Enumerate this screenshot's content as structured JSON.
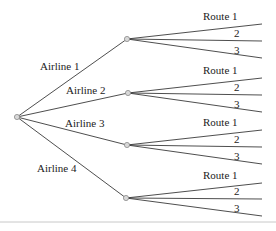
{
  "diagram": {
    "type": "tree",
    "root": {
      "x": 17,
      "y": 117
    },
    "airlines": [
      {
        "label": "Airline 1",
        "node": {
          "x": 127,
          "y": 39
        },
        "label_pos": {
          "x": 40,
          "y": 70
        },
        "routes": [
          {
            "label": "Route 1",
            "end_y": 24
          },
          {
            "label": "2",
            "end_y": 41
          },
          {
            "label": "3",
            "end_y": 58
          }
        ]
      },
      {
        "label": "Airline 2",
        "node": {
          "x": 128,
          "y": 93
        },
        "label_pos": {
          "x": 66,
          "y": 94
        },
        "routes": [
          {
            "label": "Route 1",
            "end_y": 78
          },
          {
            "label": "2",
            "end_y": 95
          },
          {
            "label": "3",
            "end_y": 112
          }
        ]
      },
      {
        "label": "Airline 3",
        "node": {
          "x": 127,
          "y": 145
        },
        "label_pos": {
          "x": 65,
          "y": 127
        },
        "routes": [
          {
            "label": "Route 1",
            "end_y": 130
          },
          {
            "label": "2",
            "end_y": 147
          },
          {
            "label": "3",
            "end_y": 164
          }
        ]
      },
      {
        "label": "Airline 4",
        "node": {
          "x": 126,
          "y": 198
        },
        "label_pos": {
          "x": 37,
          "y": 172
        },
        "routes": [
          {
            "label": "Route 1",
            "end_y": 183
          },
          {
            "label": "2",
            "end_y": 199
          },
          {
            "label": "3",
            "end_y": 216
          }
        ]
      }
    ],
    "route_end_x": 262,
    "colors": {
      "line": "#3a3a3a",
      "node_fill": "#d8d8d8",
      "node_stroke": "#8a8a8a",
      "rule": "#c8c8c8"
    }
  }
}
